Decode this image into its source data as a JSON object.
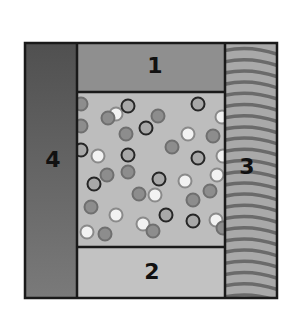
{
  "diagram": {
    "type": "schematic-cross-section",
    "colors": {
      "panel_4": "#5e5e5e",
      "panel_1": "#8f8f8f",
      "panel_2": "#c2c2c2",
      "panel_3_base": "#a9a9a9",
      "panel_3_stripes": "#6a6a6a",
      "center": "#bdbdbd",
      "border": "#1a1a1a",
      "particle_dark_ring": "#262626",
      "particle_medium": "#8d8d8d",
      "particle_white": "#f2f2f2"
    },
    "labels": {
      "panel_1": "1",
      "panel_2": "2",
      "panel_3": "3",
      "panel_4": "4"
    },
    "particles": [
      {
        "x": 81,
        "y": 104,
        "t": "m"
      },
      {
        "x": 116,
        "y": 114,
        "t": "w"
      },
      {
        "x": 108,
        "y": 118,
        "t": "m"
      },
      {
        "x": 128,
        "y": 106,
        "t": "d"
      },
      {
        "x": 158,
        "y": 116,
        "t": "m"
      },
      {
        "x": 198,
        "y": 104,
        "t": "d"
      },
      {
        "x": 222,
        "y": 117,
        "t": "w"
      },
      {
        "x": 81,
        "y": 126,
        "t": "m"
      },
      {
        "x": 146,
        "y": 128,
        "t": "d"
      },
      {
        "x": 126,
        "y": 134,
        "t": "m"
      },
      {
        "x": 188,
        "y": 134,
        "t": "w"
      },
      {
        "x": 213,
        "y": 136,
        "t": "m"
      },
      {
        "x": 81,
        "y": 150,
        "t": "d"
      },
      {
        "x": 98,
        "y": 156,
        "t": "w"
      },
      {
        "x": 128,
        "y": 155,
        "t": "d"
      },
      {
        "x": 172,
        "y": 147,
        "t": "m"
      },
      {
        "x": 198,
        "y": 158,
        "t": "d"
      },
      {
        "x": 223,
        "y": 156,
        "t": "w"
      },
      {
        "x": 107,
        "y": 175,
        "t": "m"
      },
      {
        "x": 128,
        "y": 172,
        "t": "m"
      },
      {
        "x": 94,
        "y": 184,
        "t": "d"
      },
      {
        "x": 159,
        "y": 179,
        "t": "d"
      },
      {
        "x": 185,
        "y": 181,
        "t": "w"
      },
      {
        "x": 217,
        "y": 175,
        "t": "w"
      },
      {
        "x": 139,
        "y": 194,
        "t": "m"
      },
      {
        "x": 155,
        "y": 195,
        "t": "w"
      },
      {
        "x": 193,
        "y": 200,
        "t": "m"
      },
      {
        "x": 210,
        "y": 191,
        "t": "m"
      },
      {
        "x": 91,
        "y": 207,
        "t": "m"
      },
      {
        "x": 116,
        "y": 215,
        "t": "w"
      },
      {
        "x": 166,
        "y": 215,
        "t": "d"
      },
      {
        "x": 143,
        "y": 224,
        "t": "w"
      },
      {
        "x": 153,
        "y": 231,
        "t": "m"
      },
      {
        "x": 193,
        "y": 221,
        "t": "d"
      },
      {
        "x": 216,
        "y": 220,
        "t": "w"
      },
      {
        "x": 223,
        "y": 228,
        "t": "m"
      },
      {
        "x": 87,
        "y": 232,
        "t": "w"
      },
      {
        "x": 105,
        "y": 234,
        "t": "m"
      }
    ]
  }
}
